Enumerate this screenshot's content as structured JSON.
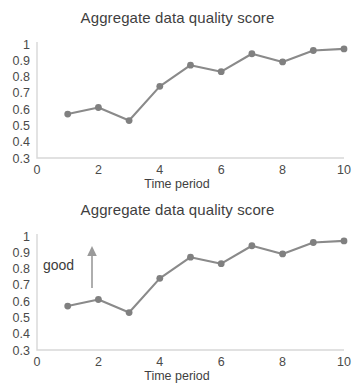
{
  "chart_data": [
    {
      "id": "chart-top",
      "type": "line",
      "title": "Aggregate data quality score",
      "xlabel": "Time period",
      "ylabel": "",
      "x": [
        1,
        2,
        3,
        4,
        5,
        6,
        7,
        8,
        9,
        10
      ],
      "values": [
        0.57,
        0.61,
        0.53,
        0.74,
        0.87,
        0.83,
        0.94,
        0.89,
        0.96,
        0.97
      ],
      "xticks": [
        "0",
        "2",
        "4",
        "6",
        "8",
        "10"
      ],
      "xtick_values": [
        0,
        2,
        4,
        6,
        8,
        10
      ],
      "yticks": [
        "1",
        "0.9",
        "0.8",
        "0.7",
        "0.6",
        "0.5",
        "0.4",
        "0.3"
      ],
      "ytick_values": [
        1,
        0.9,
        0.8,
        0.7,
        0.6,
        0.5,
        0.4,
        0.3
      ],
      "xlim": [
        0,
        10
      ],
      "ylim": [
        0.3,
        1
      ],
      "grid": false,
      "legend": "none",
      "line_color": "#8a8a8a",
      "marker_color": "#808080",
      "annotation": null
    },
    {
      "id": "chart-bottom",
      "type": "line",
      "title": "Aggregate data quality score",
      "xlabel": "Time period",
      "ylabel": "",
      "x": [
        1,
        2,
        3,
        4,
        5,
        6,
        7,
        8,
        9,
        10
      ],
      "values": [
        0.57,
        0.61,
        0.53,
        0.74,
        0.87,
        0.83,
        0.94,
        0.89,
        0.96,
        0.97
      ],
      "xticks": [
        "0",
        "2",
        "4",
        "6",
        "8",
        "10"
      ],
      "xtick_values": [
        0,
        2,
        4,
        6,
        8,
        10
      ],
      "yticks": [
        "1",
        "0.9",
        "0.8",
        "0.7",
        "0.6",
        "0.5",
        "0.4",
        "0.3"
      ],
      "ytick_values": [
        1,
        0.9,
        0.8,
        0.7,
        0.6,
        0.5,
        0.4,
        0.3
      ],
      "xlim": [
        0,
        10
      ],
      "ylim": [
        0.3,
        1
      ],
      "grid": false,
      "legend": "none",
      "line_color": "#8a8a8a",
      "marker_color": "#808080",
      "annotation": {
        "text": "good",
        "arrow": "up-arrow",
        "arrow_color": "#9a9a9a"
      }
    }
  ]
}
